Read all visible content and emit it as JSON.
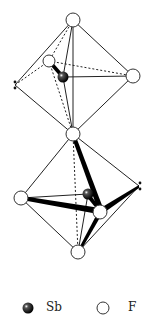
{
  "diagram": {
    "type": "molecular-structure",
    "atoms": [
      {
        "id": "F_top",
        "element": "F",
        "x": 73,
        "y": 20
      },
      {
        "id": "F_ul",
        "element": "F",
        "x": 49,
        "y": 61
      },
      {
        "id": "Sb1",
        "element": "Sb",
        "x": 63,
        "y": 77
      },
      {
        "id": "F_ur",
        "element": "F",
        "x": 133,
        "y": 76
      },
      {
        "id": "F_bridge",
        "element": "F",
        "x": 73,
        "y": 134
      },
      {
        "id": "F_ll",
        "element": "F",
        "x": 21,
        "y": 198
      },
      {
        "id": "Sb2",
        "element": "Sb",
        "x": 88,
        "y": 194
      },
      {
        "id": "F_lr",
        "element": "F",
        "x": 100,
        "y": 212
      },
      {
        "id": "F_bottom",
        "element": "F",
        "x": 78,
        "y": 252
      }
    ],
    "lone_pairs": [
      {
        "atom": "Sb1",
        "x": 15,
        "y": 85
      },
      {
        "atom": "Sb2",
        "x": 139,
        "y": 186
      }
    ]
  },
  "legend": {
    "items": [
      {
        "symbol": "Sb",
        "label": "Sb",
        "style": "filled-black-sphere"
      },
      {
        "symbol": "F",
        "label": "F",
        "style": "open-circle"
      }
    ]
  }
}
